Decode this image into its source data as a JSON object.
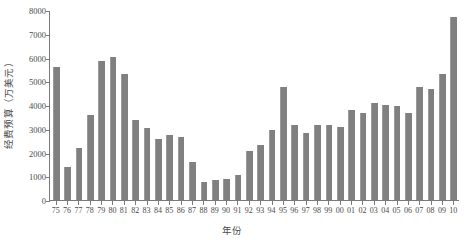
{
  "chart_data": {
    "type": "bar",
    "title": "",
    "xlabel": "年份",
    "ylabel": "经费预算（万美元）",
    "categories": [
      "75",
      "76",
      "77",
      "78",
      "79",
      "80",
      "81",
      "82",
      "83",
      "84",
      "85",
      "86",
      "87",
      "88",
      "89",
      "90",
      "91",
      "92",
      "93",
      "94",
      "95",
      "96",
      "97",
      "98",
      "99",
      "00",
      "01",
      "02",
      "03",
      "04",
      "05",
      "06",
      "07",
      "08",
      "09",
      "10"
    ],
    "values": [
      5650,
      1390,
      2220,
      3610,
      5880,
      6040,
      5350,
      3380,
      3060,
      2580,
      2740,
      2650,
      1590,
      780,
      850,
      880,
      1040,
      2060,
      2320,
      2950,
      4800,
      3190,
      2820,
      3180,
      3180,
      3110,
      3820,
      3700,
      4090,
      4020,
      3980,
      3690,
      4790,
      4720,
      5340,
      7750
    ],
    "ylim": [
      0,
      8000
    ],
    "ytick_values": [
      0,
      1000,
      2000,
      3000,
      4000,
      5000,
      6000,
      7000,
      8000
    ],
    "ytick_labels": [
      "0",
      "1000",
      "2000",
      "3000",
      "4000",
      "5000",
      "6000",
      "7000",
      "8000"
    ],
    "grid": false,
    "legend": false,
    "legend_position": "none",
    "bar_color": "#808080",
    "axis_color": "#7a7a7a",
    "background_color": "#ffffff"
  }
}
